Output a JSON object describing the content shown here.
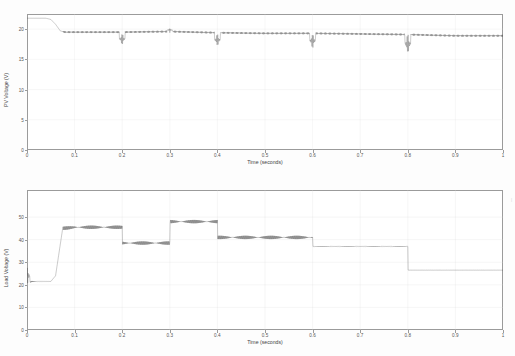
{
  "figure": {
    "background_color": "#fdfdfd",
    "trace_color": "#4a4a4a",
    "grid_color": "#dcdcdc",
    "axis_color": "#9b9b9b"
  },
  "edge_mark": "|",
  "caption_ghost": "",
  "chart_data": [
    {
      "id": "pv-voltage",
      "type": "line",
      "title": "",
      "xlabel": "Time (seconds)",
      "ylabel": "PV Voltage (V)",
      "xlim": [
        0,
        1
      ],
      "ylim": [
        0,
        22.5
      ],
      "grid": true,
      "legend": null,
      "xticks": [
        0,
        0.1,
        0.2,
        0.3,
        0.4,
        0.5,
        0.6,
        0.7,
        0.8,
        0.9,
        1
      ],
      "xticklabels": [
        "0",
        "0.1",
        "0.2",
        "0.3",
        "0.4",
        "0.5",
        "0.6",
        "0.7",
        "0.8",
        "0.9",
        "1"
      ],
      "yticks": [
        0,
        5,
        10,
        15,
        20
      ],
      "yticklabels": [
        "0",
        "5",
        "10",
        "15",
        "20"
      ],
      "series": [
        {
          "name": "PV Voltage",
          "x": [
            0,
            0.005,
            0.04,
            0.05,
            0.06,
            0.07,
            0.08,
            0.1,
            0.15,
            0.2,
            0.3,
            0.4,
            0.5,
            0.6,
            0.7,
            0.8,
            0.9,
            1
          ],
          "y": [
            21.8,
            21.8,
            21.8,
            21.6,
            20.8,
            19.7,
            19.5,
            19.5,
            19.5,
            19.5,
            19.6,
            19.4,
            19.3,
            19.3,
            19.2,
            19.1,
            18.9,
            18.9
          ]
        }
      ],
      "annotations": [
        {
          "label": "transient spike down",
          "x": 0.2,
          "y_min": 16.8,
          "y_max": 19.9
        },
        {
          "label": "transient spike up",
          "x": 0.3,
          "y_min": 19.4,
          "y_max": 20.3
        },
        {
          "label": "transient spike down",
          "x": 0.4,
          "y_min": 16.5,
          "y_max": 19.9
        },
        {
          "label": "transient spike down",
          "x": 0.6,
          "y_min": 16.0,
          "y_max": 20.1
        },
        {
          "label": "transient spike down",
          "x": 0.8,
          "y_min": 14.8,
          "y_max": 20.3
        }
      ],
      "notes": "Starts ~21.8 V, settles to ~19.5 V after 0.07 s; ripple band visible; transient spikes at load-change instants 0.2, 0.3, 0.4, 0.6, 0.8 s; slight downward drift to ~18.9 V."
    },
    {
      "id": "load-voltage",
      "type": "line",
      "title": "",
      "xlabel": "Time (seconds)",
      "ylabel": "Load Voltage (V)",
      "xlim": [
        0,
        1
      ],
      "ylim": [
        0,
        62
      ],
      "grid": true,
      "legend": null,
      "xticks": [
        0,
        0.1,
        0.2,
        0.3,
        0.4,
        0.5,
        0.6,
        0.7,
        0.8,
        0.9,
        1
      ],
      "xticklabels": [
        "0",
        "0.1",
        "0.2",
        "0.3",
        "0.4",
        "0.5",
        "0.6",
        "0.7",
        "0.8",
        "0.9",
        "1"
      ],
      "yticks": [
        0,
        10,
        20,
        30,
        40,
        50
      ],
      "yticklabels": [
        "0",
        "10",
        "20",
        "30",
        "40",
        "50"
      ],
      "series": [
        {
          "name": "Load Voltage",
          "x": [
            0,
            0.004,
            0.01,
            0.02,
            0.05,
            0.06,
            0.075,
            0.1,
            0.2,
            0.2,
            0.3,
            0.3,
            0.4,
            0.4,
            0.6,
            0.6,
            0.8,
            0.8,
            1
          ],
          "y": [
            26,
            21,
            21.5,
            21.5,
            21.5,
            24,
            45,
            45.5,
            45.5,
            38.5,
            38.5,
            48,
            48,
            41,
            41,
            37,
            37,
            26.5,
            26.5
          ]
        }
      ],
      "annotations": [
        {
          "label": "startup oscillation",
          "x": 0.0,
          "y_min": 17,
          "y_max": 31
        },
        {
          "label": "step up to plateau 1",
          "x": 0.07,
          "y": 45.5
        },
        {
          "label": "step down to plateau 2",
          "x": 0.2,
          "y": 38.5
        },
        {
          "label": "step up to plateau 3",
          "x": 0.3,
          "y": 48
        },
        {
          "label": "step down to plateau 4",
          "x": 0.4,
          "y": 41
        },
        {
          "label": "step down to plateau 5",
          "x": 0.6,
          "y": 37
        },
        {
          "label": "step down to plateau 6",
          "x": 0.8,
          "y": 26.5
        }
      ],
      "notes": "Initial oscillatory transient around 21-26 V, rises to ~45.5 V at 0.07 s, then steps: 38.5 V at 0.2 s, 48 V at 0.3 s, 41 V at 0.4 s, 37 V at 0.6 s, 26.5 V at 0.8 s. Switching ripple visible on plateaus before 0.6 s."
    }
  ]
}
